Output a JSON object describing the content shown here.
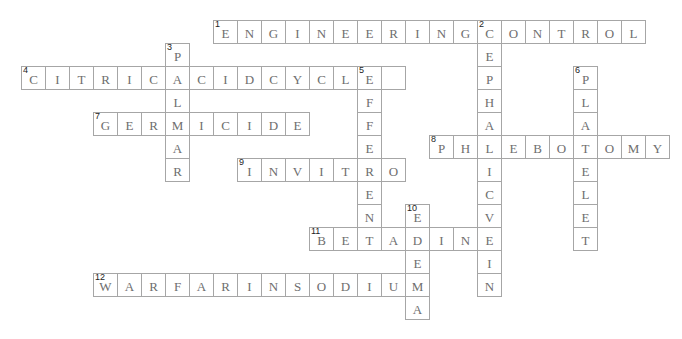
{
  "puzzle": {
    "grid": {
      "origin_x": 21,
      "origin_y": 20,
      "cell_width": 24,
      "cell_height": 23
    },
    "colors": {
      "border": "#a6a6a6",
      "letter": "#6e6e6e",
      "number": "#222222",
      "background": "#ffffff"
    },
    "words": [
      {
        "number": 1,
        "direction": "across",
        "row": 0,
        "col": 8,
        "answer": "ENGINEERINGCONTROL"
      },
      {
        "number": 2,
        "direction": "down",
        "row": 0,
        "col": 19,
        "answer": "CEPHALICVEIN"
      },
      {
        "number": 3,
        "direction": "down",
        "row": 1,
        "col": 6,
        "answer": "PALMAR"
      },
      {
        "number": 4,
        "direction": "across",
        "row": 2,
        "col": 0,
        "answer": "CITRICACIDCYCLE"
      },
      {
        "number": 5,
        "direction": "down",
        "row": 2,
        "col": 14,
        "answer": "EFFERENT"
      },
      {
        "number": 6,
        "direction": "down",
        "row": 2,
        "col": 23,
        "answer": "PLATELET"
      },
      {
        "number": 7,
        "direction": "across",
        "row": 4,
        "col": 3,
        "answer": "GERMICIDE"
      },
      {
        "number": 8,
        "direction": "across",
        "row": 5,
        "col": 17,
        "answer": "PHLEBOTOMY"
      },
      {
        "number": 9,
        "direction": "across",
        "row": 6,
        "col": 9,
        "answer": "INVITRO"
      },
      {
        "number": 10,
        "direction": "down",
        "row": 8,
        "col": 16,
        "answer": "EDEMA"
      },
      {
        "number": 11,
        "direction": "across",
        "row": 9,
        "col": 12,
        "answer": "BETADINE"
      },
      {
        "number": 12,
        "direction": "across",
        "row": 11,
        "col": 0,
        "answer": "WARFARINSODIUM",
        "col_offset": 3
      }
    ],
    "extra_empty_cells": [
      {
        "row": 2,
        "col": 15
      }
    ]
  }
}
